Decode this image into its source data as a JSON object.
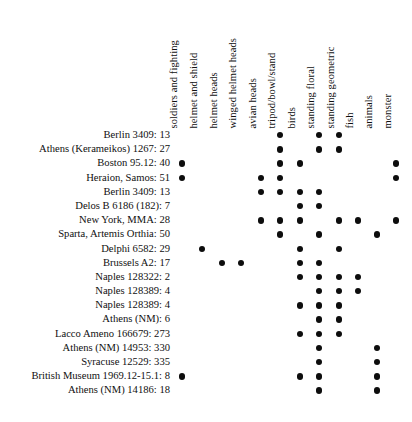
{
  "figure": {
    "name": "presence-absence-matrix",
    "type": "dot-matrix",
    "dot_color": "#0d0d0d",
    "background_color": "#ffffff"
  },
  "columns": [
    {
      "label": "soldiers and fighting",
      "x": 182
    },
    {
      "label": "helmet and shield",
      "x": 202
    },
    {
      "label": "helmet heads",
      "x": 222
    },
    {
      "label": "winged helmet heads",
      "x": 241
    },
    {
      "label": "avian heads",
      "x": 261
    },
    {
      "label": "tripod/bowl/stand",
      "x": 280
    },
    {
      "label": "birds",
      "x": 300
    },
    {
      "label": "standing floral",
      "x": 319
    },
    {
      "label": "standing geometric",
      "x": 339
    },
    {
      "label": "fish",
      "x": 358
    },
    {
      "label": "animals",
      "x": 377
    },
    {
      "label": "monster",
      "x": 396
    }
  ],
  "rows": [
    {
      "label": "Berlin 3409: 13",
      "dots": [
        0,
        0,
        0,
        0,
        0,
        1,
        0,
        1,
        1,
        0,
        0,
        0
      ]
    },
    {
      "label": "Athens (Kerameikos) 1267: 27",
      "dots": [
        0,
        0,
        0,
        0,
        0,
        1,
        0,
        1,
        1,
        0,
        0,
        0
      ]
    },
    {
      "label": "Boston 95.12: 40",
      "dots": [
        1,
        0,
        0,
        0,
        0,
        1,
        1,
        0,
        0,
        0,
        0,
        1
      ]
    },
    {
      "label": "Heraion, Samos: 51",
      "dots": [
        1,
        0,
        0,
        0,
        1,
        1,
        0,
        0,
        0,
        0,
        0,
        1
      ]
    },
    {
      "label": "Berlin 3409: 13",
      "dots": [
        0,
        0,
        0,
        0,
        1,
        1,
        1,
        1,
        0,
        0,
        0,
        0
      ]
    },
    {
      "label": "Delos B 6186 (182): 7",
      "dots": [
        0,
        0,
        0,
        0,
        0,
        0,
        1,
        1,
        0,
        0,
        0,
        0
      ]
    },
    {
      "label": "New York, MMA: 28",
      "dots": [
        0,
        0,
        0,
        0,
        1,
        1,
        1,
        0,
        1,
        1,
        0,
        1
      ]
    },
    {
      "label": "Sparta, Artemis Orthia: 50",
      "dots": [
        0,
        0,
        0,
        0,
        0,
        1,
        0,
        1,
        0,
        0,
        1,
        0
      ]
    },
    {
      "label": "Delphi 6582: 29",
      "dots": [
        0,
        1,
        0,
        0,
        0,
        0,
        1,
        0,
        1,
        0,
        0,
        0
      ]
    },
    {
      "label": "Brussels A2: 17",
      "dots": [
        0,
        0,
        1,
        1,
        0,
        0,
        1,
        1,
        0,
        0,
        0,
        0
      ]
    },
    {
      "label": "Naples 128322: 2",
      "dots": [
        0,
        0,
        0,
        0,
        0,
        0,
        1,
        1,
        1,
        1,
        0,
        0
      ]
    },
    {
      "label": "Naples 128389: 4",
      "dots": [
        0,
        0,
        0,
        0,
        0,
        0,
        0,
        1,
        1,
        1,
        0,
        0
      ]
    },
    {
      "label": "Naples 128389: 4",
      "dots": [
        0,
        0,
        0,
        0,
        0,
        0,
        1,
        1,
        1,
        0,
        0,
        0
      ]
    },
    {
      "label": "Athens (NM): 6",
      "dots": [
        0,
        0,
        0,
        0,
        0,
        0,
        0,
        1,
        1,
        0,
        0,
        0
      ]
    },
    {
      "label": "Lacco Ameno 166679: 273",
      "dots": [
        0,
        0,
        0,
        0,
        0,
        0,
        1,
        1,
        1,
        0,
        0,
        0
      ]
    },
    {
      "label": "Athens (NM) 14953: 330",
      "dots": [
        0,
        0,
        0,
        0,
        0,
        0,
        0,
        1,
        0,
        0,
        1,
        0
      ]
    },
    {
      "label": "Syracuse 12529: 335",
      "dots": [
        0,
        0,
        0,
        0,
        0,
        0,
        0,
        1,
        0,
        0,
        1,
        0
      ]
    },
    {
      "label": "British Museum 1969.12-15.1: 8",
      "dots": [
        1,
        0,
        0,
        0,
        0,
        0,
        1,
        1,
        0,
        0,
        1,
        0
      ]
    },
    {
      "label": "Athens (NM) 14186: 18",
      "dots": [
        0,
        0,
        0,
        0,
        0,
        0,
        0,
        1,
        0,
        0,
        1,
        0
      ]
    }
  ]
}
